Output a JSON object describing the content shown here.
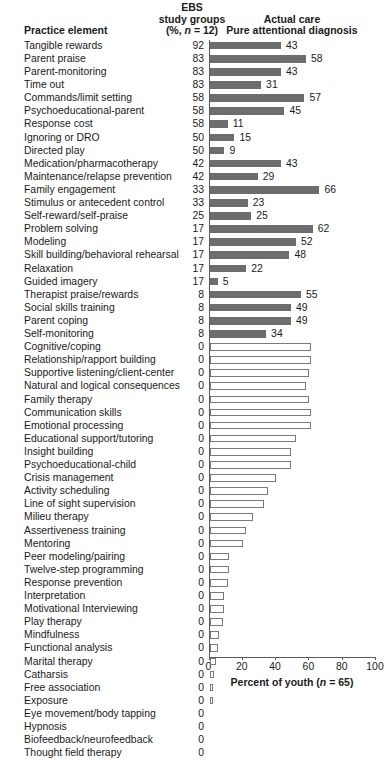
{
  "header": {
    "practice_element": "Practice element",
    "ebs_line1": "EBS",
    "ebs_line2": "study groups",
    "ebs_line3_pre": "(%, ",
    "ebs_line3_ital": "n",
    "ebs_line3_post": " = 12)",
    "actual_line1": "Actual care",
    "actual_line2": "Pure attentional diagnosis"
  },
  "axis": {
    "title_pre": "Percent of youth (",
    "title_ital": "n",
    "title_post": " = 65)",
    "ticks": [
      "0",
      "20",
      "40",
      "60",
      "80",
      "100"
    ]
  },
  "chart_data": {
    "type": "bar",
    "orientation": "horizontal",
    "title": "",
    "xlabel": "Percent of youth (n = 65)",
    "ylabel": "Practice element",
    "xlim": [
      0,
      100
    ],
    "xticks": [
      0,
      20,
      40,
      60,
      80,
      100
    ],
    "grid": false,
    "legend": "none",
    "columns": [
      "Practice element",
      "EBS study groups (%, n = 12)",
      "Actual care Pure attentional diagnosis"
    ],
    "categories": [
      "Tangible rewards",
      "Parent praise",
      "Parent-monitoring",
      "Time out",
      "Commands/limit setting",
      "Psychoeducational-parent",
      "Response cost",
      "Ignoring or DRO",
      "Directed play",
      "Medication/pharmacotherapy",
      "Maintenance/relapse prevention",
      "Family engagement",
      "Stimulus or antecedent control",
      "Self-reward/self-praise",
      "Problem solving",
      "Modeling",
      "Skill building/behavioral rehearsal",
      "Relaxation",
      "Guided imagery",
      "Therapist praise/rewards",
      "Social skills training",
      "Parent coping",
      "Self-monitoring",
      "Cognitive/coping",
      "Relationship/rapport building",
      "Supportive listening/client-center",
      "Natural and logical consequences",
      "Family therapy",
      "Communication skills",
      "Emotional processing",
      "Educational support/tutoring",
      "Insight building",
      "Psychoeducational-child",
      "Crisis management",
      "Activity scheduling",
      "Line of sight supervision",
      "Milieu therapy",
      "Assertiveness training",
      "Mentoring",
      "Peer modeling/pairing",
      "Twelve-step programming",
      "Response prevention",
      "Interpretation",
      "Motivational Interviewing",
      "Play therapy",
      "Mindfulness",
      "Functional analysis",
      "Marital therapy",
      "Catharsis",
      "Free association",
      "Exposure",
      "Eye movement/body tapping",
      "Hypnosis",
      "Biofeedback/neurofeedback",
      "Thought field therapy"
    ],
    "series": [
      {
        "name": "EBS study groups (%, n = 12)",
        "kind": "text-column",
        "values": [
          92,
          83,
          83,
          83,
          58,
          58,
          58,
          50,
          50,
          42,
          42,
          33,
          33,
          25,
          17,
          17,
          17,
          17,
          17,
          8,
          8,
          8,
          8,
          0,
          0,
          0,
          0,
          0,
          0,
          0,
          0,
          0,
          0,
          0,
          0,
          0,
          0,
          0,
          0,
          0,
          0,
          0,
          0,
          0,
          0,
          0,
          0,
          0,
          0,
          0,
          0,
          0,
          0,
          0,
          0
        ]
      },
      {
        "name": "Actual care Pure attentional diagnosis",
        "kind": "bars",
        "values": [
          43,
          58,
          43,
          31,
          57,
          45,
          11,
          15,
          9,
          43,
          29,
          66,
          23,
          25,
          62,
          52,
          48,
          22,
          5,
          55,
          49,
          49,
          34,
          61,
          61,
          60,
          58,
          60,
          61,
          61,
          52,
          49,
          49,
          40,
          35,
          33,
          26,
          22,
          20,
          12,
          12,
          11,
          9,
          9,
          8,
          6,
          5,
          4,
          3,
          2,
          2,
          0,
          0,
          0,
          0
        ],
        "labeled_through_index": 22,
        "fill_style_filled_through_index": 22,
        "fill_style_hollow_from_index": 23,
        "fill_color": "#6d6d6d",
        "hollow_border_color": "#7a7a7a"
      }
    ]
  }
}
